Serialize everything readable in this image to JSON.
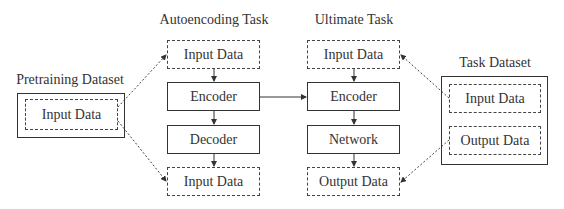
{
  "pretraining": {
    "title": "Pretraining Dataset",
    "input_label": "Input Data"
  },
  "autoencoding": {
    "title": "Autoencoding Task",
    "input_top": "Input Data",
    "encoder": "Encoder",
    "decoder": "Decoder",
    "input_bottom": "Input Data"
  },
  "ultimate": {
    "title": "Ultimate Task",
    "input_top": "Input Data",
    "encoder": "Encoder",
    "network": "Network",
    "output_bottom": "Output Data"
  },
  "task_dataset": {
    "title": "Task Dataset",
    "input_label": "Input Data",
    "output_label": "Output Data"
  },
  "colors": {
    "line": "#333333",
    "background": "#ffffff"
  }
}
